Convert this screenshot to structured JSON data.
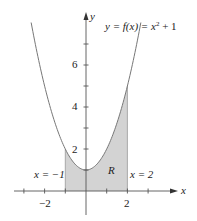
{
  "chart_data": {
    "type": "area",
    "title": "",
    "function_label": "y = f(x) = x² + 1",
    "function": "x^2 + 1",
    "region_label": "R",
    "region_bounds": {
      "x_left": -1,
      "x_right": 2
    },
    "left_bound_label": "x = −1",
    "right_bound_label": "x = 2",
    "xlabel": "x",
    "ylabel": "y",
    "x_tick_labels": [
      "−2",
      "2"
    ],
    "y_tick_labels": [
      "2",
      "4",
      "6"
    ],
    "xlim": [
      -3,
      4.3
    ],
    "ylim": [
      -1.1,
      8.5
    ],
    "grid": false,
    "colors": {
      "region_fill": "#d3d3d3",
      "curve": "#777777",
      "axes": "#555555"
    }
  },
  "labels": {
    "func": "y = f(x) = x",
    "func_sup": "2",
    "func_tail": " + 1",
    "region": "R",
    "left_bound": "x = −1",
    "right_bound": "x = 2",
    "x_axis": "x",
    "y_axis": "y",
    "xt_neg2": "−2",
    "xt_2": "2",
    "yt_2": "2",
    "yt_4": "4",
    "yt_6": "6"
  }
}
